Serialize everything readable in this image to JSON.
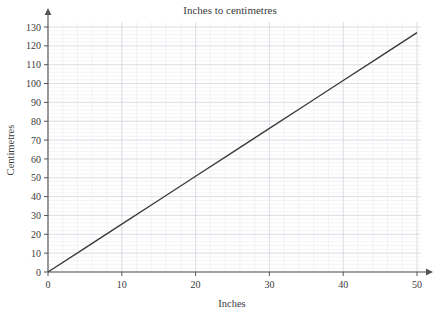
{
  "chart_data": {
    "type": "line",
    "title": "Inches to centimetres",
    "xlabel": "Inches",
    "ylabel": "Centimetres",
    "xlim": [
      0,
      50
    ],
    "ylim": [
      0,
      130
    ],
    "xticks": [
      0,
      10,
      20,
      30,
      40,
      50
    ],
    "yticks": [
      0,
      10,
      20,
      30,
      40,
      50,
      60,
      70,
      80,
      90,
      100,
      110,
      120,
      130
    ],
    "xtick_labels": [
      "0",
      "10",
      "20",
      "30",
      "40",
      "50"
    ],
    "ytick_labels": [
      "0",
      "10",
      "20",
      "30",
      "40",
      "50",
      "60",
      "70",
      "80",
      "90",
      "100",
      "110",
      "120",
      "130"
    ],
    "grid": true,
    "grid_major_step_x": 10,
    "grid_major_step_y": 10,
    "grid_minor_step_x": 2,
    "grid_minor_step_y": 2,
    "legend": false,
    "series": [
      {
        "name": "inches to centimetres",
        "x": [
          0,
          50
        ],
        "values": [
          0,
          127
        ],
        "points": [
          {
            "x": 0,
            "y": 0
          },
          {
            "x": 5,
            "y": 12.7
          },
          {
            "x": 10,
            "y": 25.4
          },
          {
            "x": 15,
            "y": 38.1
          },
          {
            "x": 20,
            "y": 50.8
          },
          {
            "x": 25,
            "y": 63.5
          },
          {
            "x": 30,
            "y": 76.2
          },
          {
            "x": 35,
            "y": 88.9
          },
          {
            "x": 40,
            "y": 101.6
          },
          {
            "x": 45,
            "y": 114.3
          },
          {
            "x": 50,
            "y": 127
          }
        ],
        "slope": 2.54,
        "intercept": 0,
        "color": "#3b3b3b"
      }
    ],
    "colors": {
      "line": "#3b3b3b",
      "axis": "#555555",
      "grid_major": "#d6d6de",
      "grid_minor": "#e9e9ee",
      "text": "#3a3a3a",
      "background": "#ffffff"
    }
  }
}
